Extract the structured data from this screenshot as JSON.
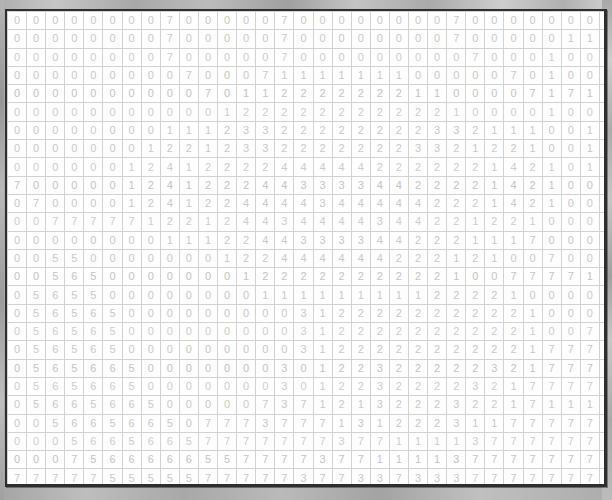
{
  "window": {
    "background_color": "#a3a3a3",
    "panel_background": "#ffffff",
    "panel_border_color": "#2e2e2e",
    "cell_text_color": "#c9c9c9",
    "cell_border_color": "#d2d2d2"
  },
  "grid": {
    "columns": 33,
    "rows": 27,
    "cell_width_px": 18,
    "cell_height_px": 17,
    "value_set": [
      0,
      1,
      2,
      3,
      4,
      5,
      6,
      7
    ],
    "rows_data": [
      [
        0,
        0,
        0,
        0,
        0,
        0,
        0,
        0,
        7,
        0,
        0,
        0,
        0,
        0,
        7,
        0,
        0,
        0,
        0,
        0,
        0,
        0,
        0,
        7,
        0,
        0,
        0,
        0,
        0,
        0,
        0,
        0,
        7
      ],
      [
        0,
        0,
        0,
        0,
        0,
        0,
        0,
        0,
        7,
        0,
        0,
        0,
        0,
        0,
        7,
        0,
        0,
        0,
        0,
        0,
        0,
        0,
        0,
        7,
        0,
        0,
        0,
        0,
        0,
        1,
        1,
        1,
        1,
        0,
        7
      ],
      [
        0,
        0,
        0,
        0,
        0,
        0,
        0,
        0,
        7,
        0,
        0,
        0,
        0,
        0,
        7,
        0,
        0,
        0,
        0,
        0,
        0,
        0,
        0,
        0,
        7,
        0,
        0,
        0,
        1,
        0,
        0,
        0,
        0,
        1,
        0
      ],
      [
        0,
        0,
        0,
        0,
        0,
        0,
        0,
        0,
        0,
        7,
        0,
        0,
        0,
        7,
        1,
        1,
        1,
        1,
        1,
        1,
        1,
        0,
        0,
        0,
        0,
        0,
        7,
        0,
        1,
        0,
        0,
        1,
        0,
        7,
        1,
        0
      ],
      [
        0,
        0,
        0,
        0,
        0,
        0,
        0,
        0,
        0,
        0,
        7,
        0,
        1,
        1,
        2,
        2,
        2,
        2,
        2,
        2,
        2,
        1,
        1,
        0,
        0,
        0,
        0,
        7,
        1,
        7,
        1,
        7,
        7,
        0,
        1,
        0
      ],
      [
        0,
        0,
        0,
        0,
        0,
        0,
        0,
        0,
        0,
        0,
        0,
        1,
        2,
        2,
        2,
        2,
        2,
        2,
        2,
        2,
        2,
        2,
        2,
        1,
        0,
        0,
        0,
        0,
        1,
        0,
        0,
        1,
        1,
        1,
        0,
        0
      ],
      [
        0,
        0,
        0,
        0,
        0,
        0,
        0,
        0,
        1,
        1,
        1,
        2,
        3,
        3,
        2,
        2,
        2,
        2,
        2,
        2,
        2,
        2,
        3,
        3,
        2,
        1,
        1,
        1,
        0,
        0,
        1,
        0,
        0,
        0,
        0,
        0
      ],
      [
        0,
        0,
        0,
        0,
        0,
        0,
        0,
        1,
        2,
        2,
        1,
        2,
        3,
        3,
        2,
        2,
        2,
        2,
        2,
        2,
        2,
        3,
        3,
        2,
        1,
        2,
        2,
        1,
        0,
        0,
        1,
        0,
        0,
        0,
        0,
        0
      ],
      [
        0,
        0,
        0,
        0,
        0,
        0,
        1,
        2,
        4,
        1,
        2,
        2,
        2,
        2,
        4,
        4,
        4,
        4,
        4,
        2,
        2,
        2,
        2,
        2,
        2,
        1,
        4,
        2,
        1,
        0,
        1,
        0,
        0,
        0,
        0,
        0
      ],
      [
        7,
        0,
        0,
        0,
        0,
        0,
        1,
        2,
        4,
        1,
        2,
        2,
        2,
        4,
        4,
        3,
        3,
        3,
        3,
        4,
        4,
        2,
        2,
        2,
        2,
        1,
        4,
        2,
        1,
        0,
        0,
        1,
        0,
        0,
        0,
        0
      ],
      [
        0,
        7,
        0,
        0,
        0,
        0,
        1,
        2,
        4,
        1,
        2,
        2,
        4,
        4,
        4,
        4,
        3,
        4,
        4,
        4,
        4,
        4,
        2,
        2,
        2,
        1,
        4,
        2,
        1,
        0,
        0,
        1,
        0,
        0,
        0,
        0
      ],
      [
        0,
        0,
        7,
        7,
        7,
        7,
        7,
        1,
        2,
        2,
        1,
        2,
        4,
        4,
        3,
        4,
        4,
        4,
        4,
        3,
        4,
        4,
        2,
        2,
        1,
        2,
        2,
        1,
        0,
        0,
        0,
        0,
        1,
        0,
        0,
        0
      ],
      [
        0,
        0,
        0,
        0,
        0,
        0,
        0,
        0,
        1,
        1,
        1,
        2,
        2,
        4,
        4,
        3,
        3,
        3,
        3,
        4,
        4,
        2,
        2,
        2,
        1,
        1,
        1,
        7,
        0,
        0,
        0,
        0,
        1,
        0,
        0,
        7
      ],
      [
        0,
        0,
        5,
        5,
        0,
        0,
        0,
        0,
        0,
        0,
        0,
        1,
        2,
        2,
        4,
        4,
        4,
        4,
        4,
        4,
        2,
        2,
        2,
        1,
        2,
        1,
        0,
        0,
        7,
        0,
        0,
        0,
        0,
        1,
        7,
        0
      ],
      [
        0,
        0,
        5,
        6,
        5,
        0,
        0,
        0,
        0,
        0,
        0,
        0,
        1,
        2,
        2,
        2,
        2,
        2,
        2,
        2,
        2,
        2,
        2,
        1,
        0,
        0,
        7,
        7,
        7,
        7,
        1,
        0,
        0,
        0,
        0,
        7
      ],
      [
        0,
        5,
        6,
        5,
        5,
        0,
        0,
        0,
        0,
        0,
        0,
        0,
        0,
        1,
        1,
        1,
        1,
        1,
        1,
        1,
        1,
        1,
        2,
        2,
        2,
        2,
        1,
        0,
        0,
        0,
        0,
        0,
        1,
        0,
        7,
        7
      ],
      [
        0,
        5,
        6,
        5,
        6,
        5,
        0,
        0,
        0,
        0,
        0,
        0,
        0,
        0,
        0,
        3,
        1,
        2,
        2,
        2,
        2,
        2,
        2,
        2,
        2,
        2,
        2,
        1,
        0,
        0,
        0,
        0,
        1,
        7,
        7,
        7
      ],
      [
        0,
        5,
        6,
        5,
        6,
        5,
        0,
        0,
        0,
        0,
        0,
        0,
        0,
        0,
        0,
        3,
        1,
        2,
        2,
        2,
        2,
        2,
        2,
        2,
        2,
        2,
        2,
        1,
        0,
        0,
        7,
        7,
        7,
        1,
        7,
        7
      ],
      [
        0,
        5,
        6,
        5,
        6,
        5,
        0,
        0,
        0,
        0,
        0,
        0,
        0,
        0,
        0,
        3,
        1,
        2,
        2,
        2,
        2,
        2,
        2,
        2,
        2,
        2,
        2,
        1,
        7,
        7,
        7,
        7,
        7,
        1,
        7,
        7
      ],
      [
        0,
        5,
        6,
        5,
        6,
        6,
        5,
        0,
        0,
        0,
        0,
        0,
        0,
        0,
        3,
        0,
        1,
        2,
        2,
        3,
        2,
        2,
        2,
        2,
        2,
        3,
        2,
        1,
        7,
        7,
        7,
        7,
        1,
        7,
        7,
        7
      ],
      [
        0,
        5,
        6,
        5,
        6,
        6,
        5,
        0,
        0,
        0,
        0,
        0,
        0,
        0,
        3,
        0,
        1,
        2,
        2,
        3,
        2,
        2,
        2,
        2,
        3,
        2,
        1,
        7,
        7,
        7,
        7,
        1,
        7,
        7,
        7,
        7
      ],
      [
        0,
        5,
        6,
        6,
        5,
        6,
        6,
        5,
        0,
        0,
        0,
        0,
        0,
        7,
        3,
        7,
        1,
        2,
        1,
        3,
        2,
        2,
        2,
        3,
        2,
        2,
        1,
        7,
        1,
        1,
        1,
        7,
        7,
        7,
        7,
        7
      ],
      [
        0,
        0,
        5,
        6,
        6,
        5,
        6,
        6,
        5,
        0,
        7,
        7,
        7,
        3,
        7,
        7,
        7,
        1,
        3,
        1,
        2,
        2,
        2,
        3,
        1,
        1,
        7,
        7,
        7,
        7,
        7,
        7,
        7,
        7,
        7,
        7
      ],
      [
        0,
        0,
        0,
        5,
        6,
        6,
        5,
        6,
        6,
        5,
        7,
        7,
        7,
        7,
        7,
        7,
        7,
        3,
        7,
        7,
        1,
        1,
        1,
        1,
        3,
        7,
        7,
        7,
        7,
        7,
        7,
        7,
        7,
        7,
        7,
        7
      ],
      [
        0,
        0,
        0,
        7,
        5,
        6,
        6,
        6,
        6,
        6,
        5,
        5,
        7,
        7,
        7,
        7,
        3,
        7,
        7,
        1,
        1,
        1,
        1,
        3,
        7,
        7,
        7,
        7,
        7,
        7,
        7,
        7,
        7,
        7,
        7,
        7
      ],
      [
        7,
        7,
        7,
        7,
        7,
        5,
        5,
        5,
        5,
        5,
        7,
        7,
        7,
        7,
        7,
        3,
        7,
        7,
        3,
        3,
        7,
        3,
        3,
        3,
        7,
        7,
        7,
        7,
        7,
        7,
        7,
        7,
        7,
        7,
        7,
        7
      ],
      [
        7,
        7,
        7,
        7,
        7,
        7,
        7,
        7,
        7,
        7,
        7,
        7,
        7,
        7,
        7,
        7,
        7,
        7,
        7,
        7,
        7,
        7,
        7,
        7,
        7,
        7,
        7,
        7,
        7,
        7,
        7,
        7,
        7,
        7,
        7,
        7
      ]
    ]
  }
}
